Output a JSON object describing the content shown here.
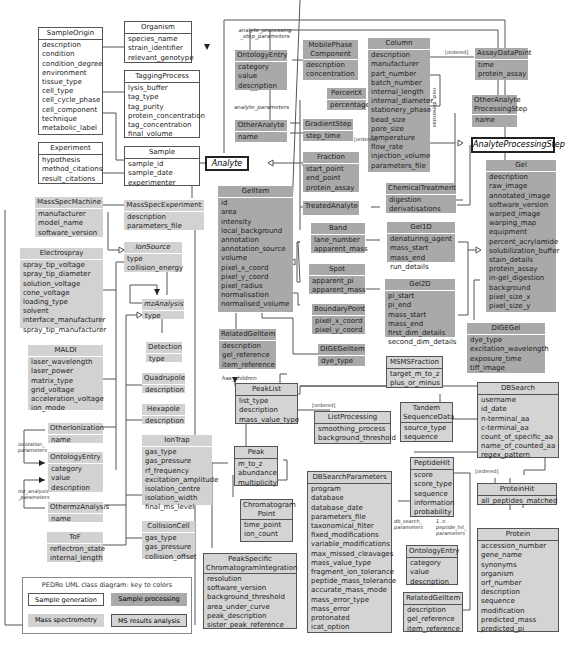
{
  "diagram": {
    "classes": {
      "SampleOrigin": {
        "name": "SampleOrigin",
        "attrs": [
          "description",
          "condition",
          "condition_degree",
          "environment",
          "tissue_type",
          "cell_type",
          "cell_cycle_phase",
          "cell_component",
          "technique",
          "metabolic_label"
        ]
      },
      "Organism": {
        "name": "Organism",
        "attrs": [
          "species_name",
          "strain_identifier",
          "relevant_genotype"
        ]
      },
      "TaggingProcess": {
        "name": "TaggingProcess",
        "attrs": [
          "lysis_buffer",
          "tag_type",
          "tag_purity",
          "protein_concentration",
          "tag_concentration",
          "final_volume"
        ]
      },
      "Experiment": {
        "name": "Experiment",
        "attrs": [
          "hypothesis",
          "method_citations",
          "result_citations"
        ]
      },
      "Sample": {
        "name": "Sample",
        "attrs": [
          "sample_id",
          "sample_date",
          "experimenter"
        ]
      },
      "MassSpecMachine": {
        "name": "MassSpecMachine",
        "attrs": [
          "manufacturer",
          "model_name",
          "software_version"
        ]
      },
      "MassSpecExperiment": {
        "name": "MassSpecExperiment",
        "attrs": [
          "description",
          "parameters_file"
        ]
      },
      "Electrospray": {
        "name": "Electrospray",
        "attrs": [
          "spray_tip_voltage",
          "spray_tip_diameter",
          "solution_voltage",
          "cone_voltage",
          "loading_type",
          "solvent",
          "interface_manufacturer",
          "spray_tip_manufacturer"
        ]
      },
      "IonSource": {
        "name": "IonSource",
        "attrs": [
          "type",
          "collision_energy"
        ]
      },
      "mzAnalysis": {
        "name": "mzAnalysis",
        "attrs": [
          "type"
        ]
      },
      "Detection": {
        "name": "Detection",
        "attrs": [
          "type"
        ]
      },
      "MALDI": {
        "name": "MALDI",
        "attrs": [
          "laser_wavelength",
          "laser_power",
          "matrix_type",
          "grid_voltage",
          "acceleration_voltage",
          "ion_mode"
        ]
      },
      "Quadrupole": {
        "name": "Quadrupole",
        "attrs": [
          "description"
        ]
      },
      "Hexapole": {
        "name": "Hexapole",
        "attrs": [
          "description"
        ]
      },
      "OtherIonization": {
        "name": "OtherIonization",
        "attrs": [
          "name"
        ]
      },
      "OntologyEntryMS": {
        "name": "OntologyEntry",
        "attrs": [
          "category",
          "value",
          "description"
        ]
      },
      "OthermzAnalysis": {
        "name": "OthermzAnalysis",
        "attrs": [
          "name"
        ]
      },
      "IonTrap": {
        "name": "IonTrap",
        "attrs": [
          "gas_type",
          "gas_pressure",
          "rf_frequency",
          "excitation_amplitude",
          "isolation_centre",
          "isolation_width",
          "final_ms_level"
        ]
      },
      "CollisionCell": {
        "name": "CollisionCell",
        "attrs": [
          "gas_type",
          "gas_pressure",
          "collision_offset"
        ]
      },
      "ToF": {
        "name": "ToF",
        "attrs": [
          "reflectron_state",
          "internal_length"
        ]
      },
      "OntologyEntryTop": {
        "name": "OntologyEntry",
        "attrs": [
          "category",
          "value",
          "description"
        ]
      },
      "OtherAnalyte": {
        "name": "OtherAnalyte",
        "attrs": [
          "name"
        ]
      },
      "Analyte": {
        "name": "Analyte"
      },
      "MobilePhaseComponent": {
        "name": "MobilePhase Component",
        "attrs": [
          "description",
          "concentration"
        ]
      },
      "PercentX": {
        "name": "PercentX",
        "attrs": [
          "percentage"
        ]
      },
      "GradientStep": {
        "name": "GradientStep",
        "attrs": [
          "step_time"
        ]
      },
      "Fraction": {
        "name": "Fraction",
        "attrs": [
          "start_point",
          "end_point",
          "protein_assay"
        ]
      },
      "TreatedAnalyte": {
        "name": "TreatedAnalyte"
      },
      "Column": {
        "name": "Column",
        "attrs": [
          "description",
          "manufacturer",
          "part_number",
          "batch_number",
          "internal_length",
          "internal_diameter",
          "stationery_phase",
          "bead_size",
          "pore_size",
          "temperature",
          "flow_rate",
          "injection_volume",
          "parameters_file"
        ]
      },
      "AssayDataPoint": {
        "name": "AssayDataPoint",
        "attrs": [
          "time",
          "protein_assay"
        ]
      },
      "OtherAnalyteProcessingStep": {
        "name": "OtherAnalyte ProcessingStep",
        "attrs": [
          "name"
        ]
      },
      "AnalyteProcessingStep": {
        "name": "AnalyteProcessingStep"
      },
      "ChemicalTreatment": {
        "name": "ChemicalTreatment",
        "attrs": [
          "digestion",
          "derivatisations"
        ]
      },
      "Gel": {
        "name": "Gel",
        "attrs": [
          "description",
          "raw_image",
          "annotated_image",
          "software_version",
          "warped_image",
          "warping_map",
          "equipment",
          "percent_acrylamide",
          "solubilization_buffer",
          "stain_details",
          "protein_assay",
          "in-gel_digestion",
          "background",
          "pixel_size_x",
          "pixel_size_y"
        ]
      },
      "GelItem": {
        "name": "GelItem",
        "attrs": [
          "id",
          "area",
          "intensity",
          "local_background",
          "annotation",
          "annotation_source",
          "volume",
          "pixel_x_coord",
          "pixel_y_coord",
          "pixel_radius",
          "normalisation",
          "normalised_volume"
        ]
      },
      "Band": {
        "name": "Band",
        "attrs": [
          "lane_number",
          "apparent_mass"
        ]
      },
      "Spot": {
        "name": "Spot",
        "attrs": [
          "apparent_pi",
          "apparent_mass"
        ]
      },
      "BoundaryPoint": {
        "name": "BoundaryPoint",
        "attrs": [
          "pixel_x_coord",
          "pixel_y_coord"
        ]
      },
      "Gel1D": {
        "name": "Gel1D",
        "attrs": [
          "denaturing_agent",
          "mass_start",
          "mass_end",
          "run_details"
        ]
      },
      "Gel2D": {
        "name": "Gel2D",
        "attrs": [
          "pi_start",
          "pi_end",
          "mass_start",
          "mass_end",
          "first_dim_details",
          "second_dim_details"
        ]
      },
      "DIGEGel": {
        "name": "DIGEGel",
        "attrs": [
          "dye_type",
          "excitation_wavelength",
          "exposure_time",
          "tiff_image"
        ]
      },
      "RelatedGelItemTop": {
        "name": "RelatedGelItem",
        "attrs": [
          "description",
          "gel_reference",
          "item_reference"
        ]
      },
      "DIGEGelItem": {
        "name": "DIGEGelItem",
        "attrs": [
          "dye_type"
        ]
      },
      "MSMSFraction": {
        "name": "MSMSFraction",
        "attrs": [
          "target_m_to_z",
          "plus_or_minus"
        ]
      },
      "PeakList": {
        "name": "PeakList",
        "attrs": [
          "list_type",
          "description",
          "mass_value_type"
        ]
      },
      "ListProcessing": {
        "name": "ListProcessing",
        "attrs": [
          "smoothing_process",
          "background_threshold"
        ]
      },
      "TandemSequenceData": {
        "name": "Tandem SequenceData",
        "attrs": [
          "source_type",
          "sequence"
        ]
      },
      "DBSearch": {
        "name": "DBSearch",
        "attrs": [
          "username",
          "id_date",
          "n-terminal_aa",
          "c-terminal_aa",
          "count_of_specific_aa",
          "name_of_counted_aa",
          "regex_pattern"
        ]
      },
      "Peak": {
        "name": "Peak",
        "attrs": [
          "m_to_z",
          "abundance",
          "multiplicity"
        ]
      },
      "ChromatogramPoint": {
        "name": "Chromatogram Point",
        "attrs": [
          "time_point",
          "ion_count"
        ]
      },
      "PeakSpecificChromatogramIntegration": {
        "name": "PeakSpecific ChromatogramIntegration",
        "attrs": [
          "resolution",
          "software_version",
          "background_threshold",
          "area_under_curve",
          "peak_description",
          "sister_peak_reference"
        ]
      },
      "DBSearchParameters": {
        "name": "DBSearchParameters",
        "attrs": [
          "program",
          "database",
          "database_date",
          "parameters_file",
          "taxonomical_filter",
          "fixed_modifications",
          "variable_modifications",
          "max_missed_cleavages",
          "mass_value_type",
          "fragment_ion_tolerance",
          "peptide_mass_tolerance",
          "accurate_mass_mode",
          "mass_error_type",
          "mass_error",
          "protonated",
          "icat_option"
        ]
      },
      "PeptideHit": {
        "name": "PeptideHit",
        "attrs": [
          "score",
          "score_type",
          "sequence",
          "information",
          "probability"
        ]
      },
      "ProteinHit": {
        "name": "ProteinHit",
        "attrs": [
          "all_peptides_matched"
        ]
      },
      "OntologyEntryRes": {
        "name": "OntologyEntry",
        "attrs": [
          "category",
          "value",
          "description"
        ]
      },
      "RelatedGelItemRes": {
        "name": "RelatedGelItem",
        "attrs": [
          "description",
          "gel_reference",
          "item_reference"
        ]
      },
      "Protein": {
        "name": "Protein",
        "attrs": [
          "accession_number",
          "gene_name",
          "synonyms",
          "organism",
          "orf_number",
          "description",
          "sequence",
          "modification",
          "predicted_mass",
          "predicted_pi"
        ]
      }
    },
    "labels": {
      "analyte_processing_step_parameters": "analyte_processing _step_parameters",
      "analyte_parameters": "analyte_parameters",
      "ionization_parameters": "ionization_ parameters",
      "mz_analysis_parameters": "mz_analysis _parameters",
      "has_children": "has_children",
      "ordered": "[ordered]",
      "next_dimension": "next_dimension",
      "db_search_parameters": "db_search_ parameters",
      "peptide_hit_parameters": "1..n peptide_hit_ parameters"
    }
  },
  "legend": {
    "title": "PEDRo UML class diagram: key to colors",
    "items": [
      "Sample generation",
      "Sample processing",
      "Mass spectrometry",
      "MS results analysis"
    ],
    "colors": {
      "sample_generation": "#ffffff",
      "sample_processing": "#a9a9a9",
      "mass_spectrometry": "#d2d2d2",
      "ms_results_analysis": "#d4d4d4"
    }
  }
}
